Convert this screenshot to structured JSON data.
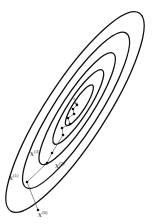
{
  "diagram": {
    "title": "",
    "type": "gradient-descent-contour-plot",
    "contour_count": 5,
    "labels": [
      {
        "id": "x0",
        "base": "x",
        "sup": "(0)"
      },
      {
        "id": "x1",
        "base": "x",
        "sup": "(1)"
      },
      {
        "id": "x2",
        "base": "x",
        "sup": "(2)"
      },
      {
        "id": "x3",
        "base": "x",
        "sup": "(3)"
      },
      {
        "id": "xstar",
        "base": "x",
        "sup": "*"
      }
    ],
    "colors": {
      "stroke": "#111111",
      "background": "#ffffff"
    }
  }
}
